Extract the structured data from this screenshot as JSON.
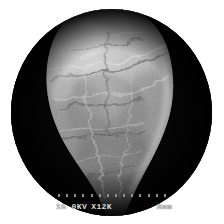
{
  "image": {
    "kind": "sem-micrograph",
    "subject": "elongated rough-surfaced particle",
    "header_caption": "",
    "aperture_shape": "circle",
    "background_color": "#ffffff",
    "field_color": "#050505",
    "particle_color": "#b9b9b9"
  },
  "annotation": {
    "accelerating_voltage": "15 0KV",
    "magnification": "X12K",
    "scale_bar_label": "3um",
    "tick_count": 14,
    "text_color": "#dedede"
  }
}
